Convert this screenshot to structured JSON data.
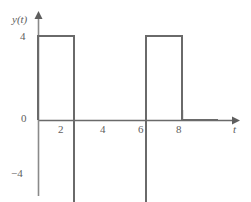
{
  "figure": {
    "background_color": "#ffffff",
    "line_color": "#6a6a6a",
    "text_color": "#5e5e5e"
  },
  "axes": {
    "y_axis_label": "y(t)",
    "x_axis_label": "t",
    "y_ticks": [
      {
        "value": 4,
        "label": "4"
      },
      {
        "value": 0,
        "label": "0"
      },
      {
        "value": -4,
        "label": "−4"
      }
    ],
    "x_ticks": [
      {
        "value": 2,
        "label": "2"
      },
      {
        "value": 4,
        "label": "4"
      },
      {
        "value": 6,
        "label": "6"
      },
      {
        "value": 8,
        "label": "8"
      }
    ]
  },
  "chart_data": {
    "type": "line",
    "title": "",
    "xlabel": "t",
    "ylabel": "y(t)",
    "xlim": [
      0,
      9.95
    ],
    "ylim": [
      -4.8,
      4.9
    ],
    "grid": false,
    "legend": "none",
    "series": [
      {
        "name": "y(t)",
        "color": "#6a6a6a",
        "x": [
          0,
          0,
          2,
          2,
          6,
          6,
          8,
          8,
          10
        ],
        "y": [
          0,
          4,
          4,
          -4,
          -4,
          4,
          4,
          0,
          0
        ]
      }
    ],
    "segments": [
      {
        "t_start": 0,
        "t_end": 2,
        "value": 4
      },
      {
        "t_start": 2,
        "t_end": 6,
        "value": -4
      },
      {
        "t_start": 6,
        "t_end": 8,
        "value": 4
      }
    ],
    "amplitude": 4,
    "period": 8
  }
}
